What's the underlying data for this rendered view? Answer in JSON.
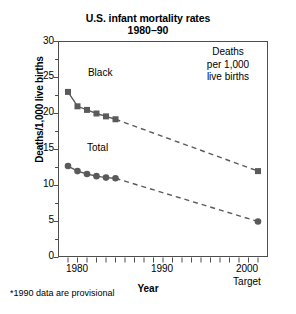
{
  "chart_data": {
    "type": "line",
    "title": "U.S. infant mortality rates",
    "subtitle": "1980–90",
    "xlabel": "Year",
    "ylabel": "Deaths/1,000 live births",
    "xlim": [
      1979,
      2001
    ],
    "ylim": [
      0,
      30
    ],
    "ytick_values": [
      0,
      5,
      10,
      15,
      20,
      25,
      30
    ],
    "ytick_labels": [
      "0",
      "5",
      "10",
      "15",
      "20",
      "25",
      "30"
    ],
    "yminor_step": 2.5,
    "xtick_values": [
      1979,
      1980,
      1981,
      1982,
      1983,
      1984,
      1985,
      1986,
      1987,
      1988,
      1989,
      1990,
      1991,
      1992,
      1993,
      1994,
      1995,
      1996,
      1997,
      1998,
      1999,
      2000,
      2001
    ],
    "xtick_labeled": [
      {
        "value": 1980,
        "label": "1980",
        "sublabel": ""
      },
      {
        "value": 1990,
        "label": "1990",
        "sublabel": ""
      },
      {
        "value": 2000,
        "label": "2000",
        "sublabel": "Target"
      }
    ],
    "grid": false,
    "legend": "direct-labels",
    "series": [
      {
        "name": "Black",
        "marker": "square",
        "color": "#5a5a5a",
        "label_x": 1982.1,
        "label_y": 25.6,
        "observed": {
          "x": [
            1980,
            1981,
            1982,
            1983,
            1984,
            1985
          ],
          "values": [
            23.0,
            21.0,
            20.5,
            20.0,
            19.6,
            19.2
          ]
        },
        "projected": {
          "x": [
            1985,
            2000
          ],
          "values": [
            19.2,
            12.0
          ],
          "style": "dashed"
        }
      },
      {
        "name": "Total",
        "marker": "circle",
        "color": "#5a5a5a",
        "label_x": 1982.0,
        "label_y": 15.2,
        "observed": {
          "x": [
            1980,
            1981,
            1982,
            1983,
            1984,
            1985
          ],
          "values": [
            12.7,
            12.0,
            11.6,
            11.3,
            11.1,
            11.0
          ]
        },
        "projected": {
          "x": [
            1985,
            2000
          ],
          "values": [
            11.0,
            5.0
          ],
          "style": "dashed"
        }
      }
    ],
    "annotations": [
      {
        "name": "units-note",
        "lines": [
          "Deaths",
          "per 1,000",
          "live births"
        ]
      },
      {
        "name": "footnote",
        "text": "*1990 data are provisional"
      }
    ]
  }
}
